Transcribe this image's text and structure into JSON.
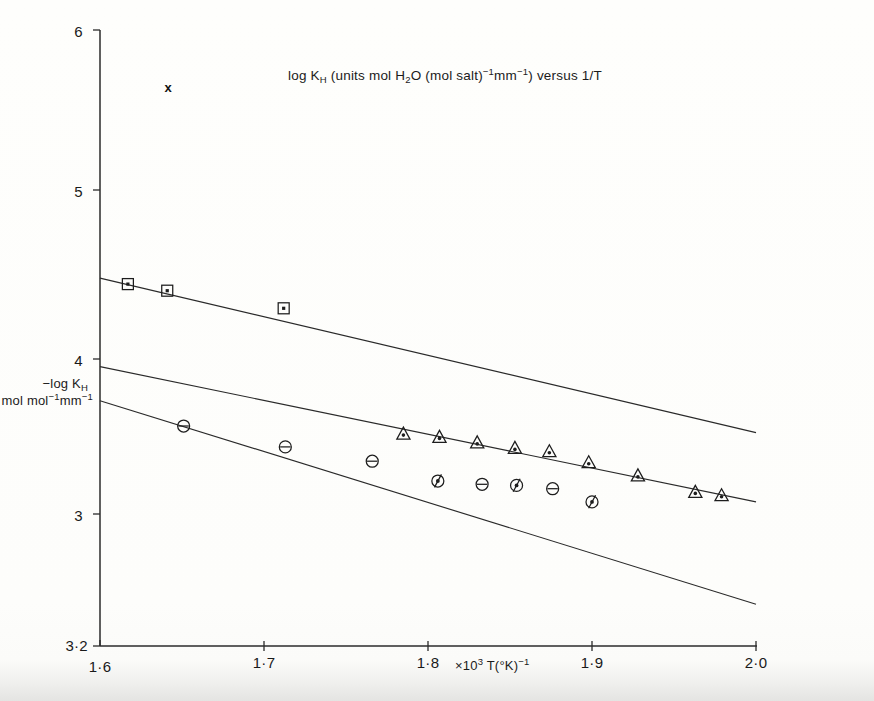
{
  "figure": {
    "title": {
      "pre": "log K",
      "sub": "H",
      "mid": " (units mol H",
      "sub2": "2",
      "mid2": "O (mol salt)",
      "sup": "−1",
      "mid3": "mm",
      "sup2": "−1",
      "mid4": ") versus ",
      "post": "1/T",
      "plain": "log KH (units mol H2O (mol salt)-1mm-1) versus 1/T"
    },
    "stray_marker": "x",
    "ylabel": {
      "line1_pre": "−log K",
      "line1_sub": "H",
      "line2_pre": "mol mol",
      "line2_sup": "−1",
      "line2_mid": "mm",
      "line2_sup2": "−1",
      "plain": "-log KH mol mol-1mm-1"
    },
    "xlabel": {
      "pre": "×10",
      "sup": "3",
      "mid": " T(°K)",
      "sup2": "−1",
      "plain": "x10^3 T(degK)^-1"
    },
    "colors": {
      "ink": "#1d1d1d",
      "axis": "#2b2b2b",
      "paper": "#fdfdfb"
    }
  },
  "chart_data": {
    "type": "scatter",
    "xlabel": "x10^3 T(degK)^-1",
    "ylabel": "-log KH / mol mol-1 mm-1",
    "xlim": [
      1.6,
      2.0
    ],
    "ylim": [
      3.2,
      6.0
    ],
    "y_axis_inverted": false,
    "grid": false,
    "legend": "none",
    "xticks": [
      1.6,
      1.7,
      1.8,
      1.9,
      2.0
    ],
    "xticklabels": [
      "1·6",
      "1·7",
      "1·8",
      "1·9",
      "2·0"
    ],
    "yticks": [
      3.2,
      3.0,
      4.0,
      5.0,
      6.0
    ],
    "yticklabels": [
      "3·2",
      "3",
      "4",
      "5",
      "6"
    ],
    "series": [
      {
        "name": "series-squares",
        "marker": "square-with-dot",
        "x": [
          1.617,
          1.641,
          1.712
        ],
        "y": [
          4.845,
          4.815,
          4.735
        ]
      },
      {
        "name": "series-triangles",
        "marker": "triangle-with-dot",
        "x": [
          1.785,
          1.807,
          1.83,
          1.853,
          1.874,
          1.898,
          1.928,
          1.963,
          1.979
        ],
        "y": [
          4.165,
          4.15,
          4.125,
          4.1,
          4.085,
          4.035,
          3.975,
          3.9,
          3.885
        ]
      },
      {
        "name": "series-circles-barred",
        "marker": "circle-with-bar",
        "x": [
          1.651,
          1.713,
          1.766,
          1.833,
          1.876
        ],
        "y": [
          4.2,
          4.105,
          4.04,
          3.935,
          3.915
        ]
      },
      {
        "name": "series-circles-dotted",
        "marker": "circle-with-dot-tail",
        "x": [
          1.806,
          1.854,
          1.9
        ],
        "y": [
          3.95,
          3.93,
          3.855
        ]
      }
    ],
    "fit_lines": [
      {
        "name": "fit-line-squares",
        "x": [
          1.6,
          2.0
        ],
        "y": [
          4.872,
          4.17
        ]
      },
      {
        "name": "fit-line-triangles",
        "x": [
          1.6,
          2.0
        ],
        "y": [
          4.47,
          3.855
        ]
      },
      {
        "name": "fit-line-circles",
        "x": [
          1.6,
          2.0
        ],
        "y": [
          4.315,
          3.39
        ]
      }
    ]
  }
}
